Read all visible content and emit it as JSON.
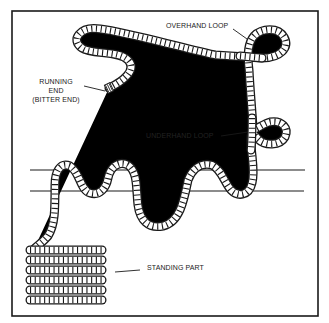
{
  "figure": {
    "frame_color": "#1a1a1a",
    "background": "#ffffff"
  },
  "labels": {
    "overhand_loop": "OVERHAND LOOP",
    "running_end_line1": "RUNNING",
    "running_end_line2": "END",
    "running_end_line3": "(BITTER END)",
    "underhand_loop": "UNDERHAND LOOP",
    "standing_part": "STANDING PART"
  },
  "parts": [
    {
      "name": "Overhand loop",
      "description": "Loop in which the rope crosses over itself"
    },
    {
      "name": "Running end (bitter end)",
      "description": "Free, working end of the rope"
    },
    {
      "name": "Underhand loop",
      "description": "Loop in which the rope crosses under itself"
    },
    {
      "name": "Standing part",
      "description": "Coiled, inactive portion of the rope"
    }
  ],
  "icons": {
    "rope": "twisted-rope-illustration",
    "bar": "horizontal-rail",
    "coil": "rope-coil"
  }
}
